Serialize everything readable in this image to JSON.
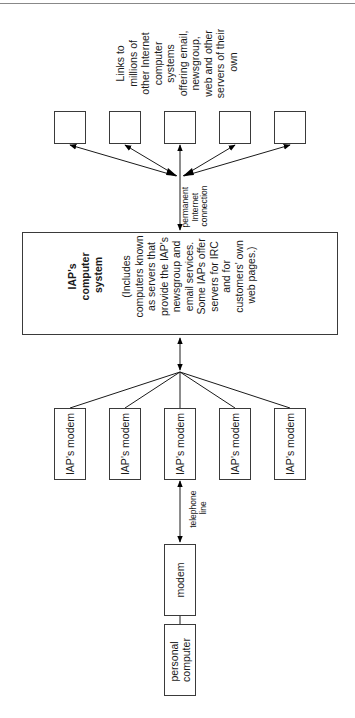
{
  "diagram": {
    "orientation": "rotated-90",
    "colors": {
      "line": "#1a1a1a",
      "box_border": "#3a3a3a",
      "background": "#ffffff",
      "rule": "#888888"
    },
    "internet_note": {
      "lines": [
        "Links to",
        "millions of",
        "other Internet",
        "computer",
        "systems",
        "offering email,",
        "newsgroup,",
        "web and other",
        "servers of their",
        "own"
      ]
    },
    "internet_nodes": [
      {
        "label": ""
      },
      {
        "label": ""
      },
      {
        "label": ""
      },
      {
        "label": ""
      },
      {
        "label": ""
      }
    ],
    "internet_connection_label": [
      "permanent",
      "Internet",
      "connection"
    ],
    "iap_system": {
      "title_lines": [
        "IAP's",
        "computer",
        "system"
      ],
      "description_lines": [
        "(Includes",
        "computers known",
        "as servers that",
        "provide the IAP's",
        "newsgroup and",
        "email services.",
        "Some IAPs offer",
        "servers for IRC",
        "and for",
        "customers' own",
        "web pages.)"
      ]
    },
    "iap_modems": [
      {
        "label": "IAP's modem"
      },
      {
        "label": "IAP's modem"
      },
      {
        "label": "IAP's modem"
      },
      {
        "label": "IAP's modem"
      },
      {
        "label": "IAP's modem"
      }
    ],
    "telephone_line_label": [
      "telephone",
      "line"
    ],
    "user_modem": {
      "label": "modem"
    },
    "personal_computer": {
      "lines": [
        "personal",
        "computer"
      ]
    }
  }
}
